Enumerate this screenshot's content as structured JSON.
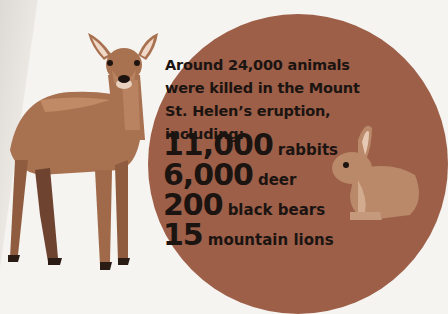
{
  "headline": {
    "line1": "Around 24,000 animals",
    "line2": "were killed in the Mount",
    "line3": "St. Helen’s eruption, including:"
  },
  "stats": [
    {
      "number": "11,000",
      "label": "rabbits"
    },
    {
      "number": "6,000",
      "label": "deer"
    },
    {
      "number": "200",
      "label": "black bears"
    },
    {
      "number": "15",
      "label": "mountain lions"
    }
  ],
  "colors": {
    "background": "#f6f4f1",
    "circle": "#9d5f48",
    "text": "#1b1411",
    "deer": "#a8714f",
    "rabbit": "#b9896a"
  },
  "illustrations": [
    "deer-illustration",
    "rabbit-illustration"
  ]
}
